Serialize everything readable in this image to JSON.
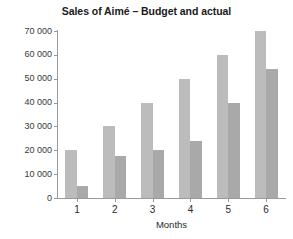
{
  "chart_data": {
    "type": "bar",
    "title": "Sales of Aimé – Budget and actual",
    "xlabel": "Months",
    "ylabel": "",
    "categories": [
      "1",
      "2",
      "3",
      "4",
      "5",
      "6"
    ],
    "series": [
      {
        "name": "Budget",
        "values": [
          20000,
          30000,
          40000,
          50000,
          60000,
          70000
        ],
        "color": "#bcbcbc"
      },
      {
        "name": "Actual",
        "values": [
          5000,
          17500,
          20000,
          24000,
          40000,
          54000
        ],
        "color": "#a9a9a9"
      }
    ],
    "ylim": [
      0,
      70000
    ],
    "ytick_values": [
      0,
      10000,
      20000,
      30000,
      40000,
      50000,
      60000,
      70000
    ],
    "ytick_labels": [
      "0",
      "10 000",
      "20 000",
      "30 000",
      "40 000",
      "50 000",
      "60 000",
      "70 000"
    ],
    "grid": false,
    "legend": "none",
    "background_color": "#ffffff",
    "axis_color": "#9a9a9a",
    "text_color": "#231f20"
  }
}
